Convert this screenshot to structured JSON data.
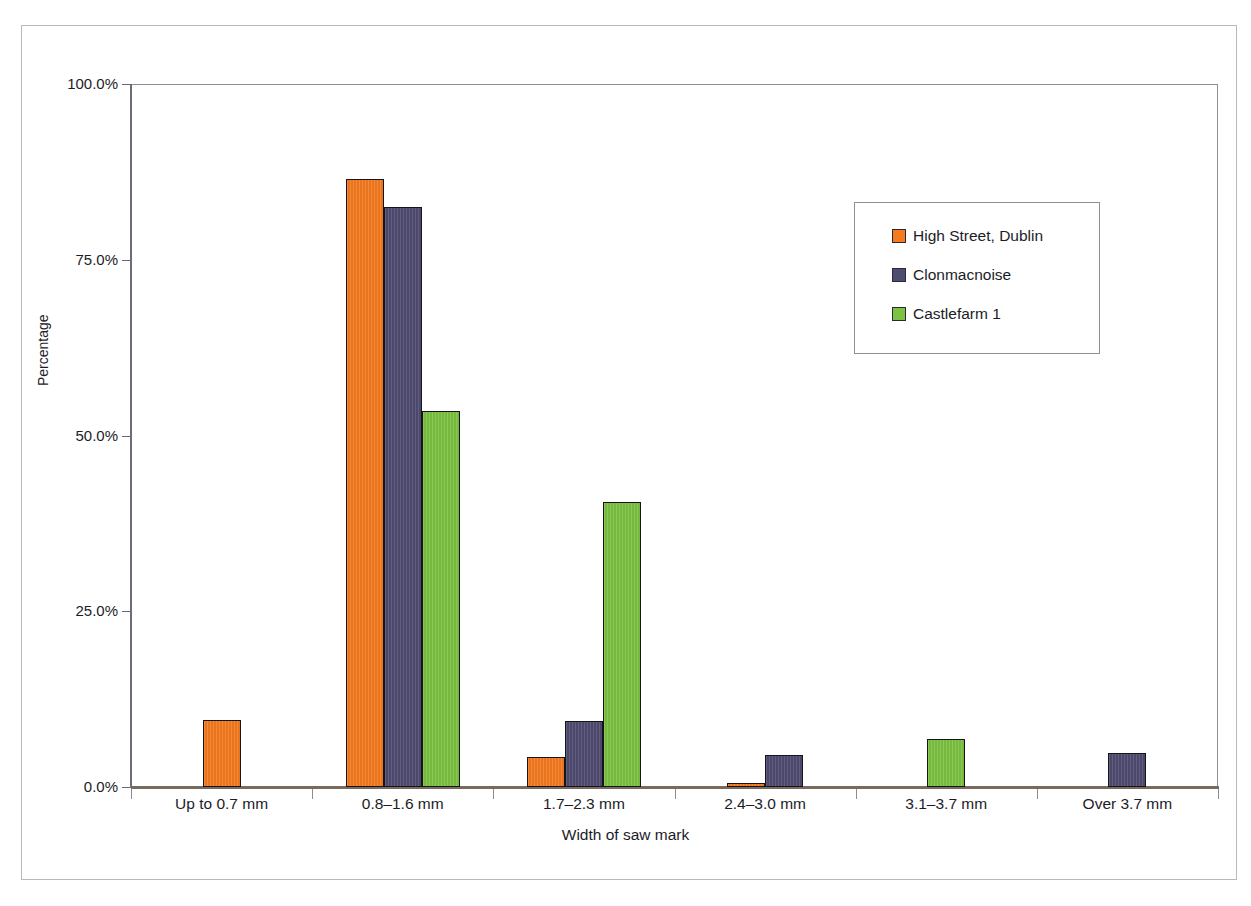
{
  "chart_data": {
    "type": "bar",
    "title": "",
    "xlabel": "Width of saw mark",
    "ylabel": "Percentage",
    "categories": [
      "Up to 0.7 mm",
      "0.8–1.6 mm",
      "1.7–2.3 mm",
      "2.4–3.0 mm",
      "3.1–3.7 mm",
      "Over 3.7 mm"
    ],
    "series": [
      {
        "name": "High Street, Dublin",
        "color": "#f47b20",
        "values": [
          9.5,
          86.5,
          4.3,
          0.5,
          0,
          0
        ]
      },
      {
        "name": "Clonmacnoise",
        "color": "#4f4c71",
        "values": [
          0,
          82.5,
          9.4,
          4.6,
          0,
          4.8
        ]
      },
      {
        "name": "Castlefarm 1",
        "color": "#7dc242",
        "values": [
          0,
          53.5,
          40.5,
          0,
          6.8,
          0
        ]
      }
    ],
    "ylim": [
      0,
      100
    ],
    "ytick_values": [
      0,
      25,
      50,
      75,
      100
    ],
    "ytick_labels": [
      "0.0%",
      "25.0%",
      "50.0%",
      "75.0%",
      "100.0%"
    ],
    "grid": false,
    "legend_position": "upper right"
  },
  "legend": {
    "entries": [
      {
        "label": "High Street, Dublin"
      },
      {
        "label": "Clonmacnoise"
      },
      {
        "label": "Castlefarm 1"
      }
    ]
  },
  "colors": {
    "series_orange": "#f47b20",
    "series_purple": "#4f4c71",
    "series_green": "#7dc242",
    "axis": "#6d6d76",
    "text": "#1c1c28",
    "page_border": "#b9b9bb"
  }
}
